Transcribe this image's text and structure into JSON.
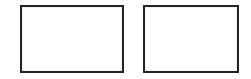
{
  "canvas": {
    "width": 251,
    "height": 79,
    "background_color": "#ffffff"
  },
  "boxes": [
    {
      "id": "box-left",
      "label": "",
      "content": "",
      "border_color": "#232323",
      "fill_color": "#ffffff",
      "x": 20,
      "y": 5,
      "width": 104,
      "height": 68
    },
    {
      "id": "box-right",
      "label": "",
      "content": "",
      "ghost_text": "",
      "border_color": "#232323",
      "fill_color": "#ffffff",
      "x": 143,
      "y": 5,
      "width": 96,
      "height": 68
    }
  ]
}
